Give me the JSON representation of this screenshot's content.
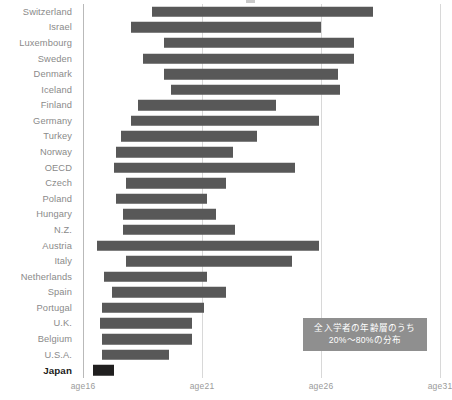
{
  "chart_data": {
    "type": "bar",
    "orientation": "horizontal",
    "subtype": "range-bar",
    "title": "",
    "subtitle": "",
    "xlabel": "",
    "ylabel": "",
    "xlim": [
      16,
      31
    ],
    "grid": true,
    "x_ticks": [
      16,
      21,
      26,
      31
    ],
    "x_tick_labels": [
      "age16",
      "age21",
      "age26",
      "age31"
    ],
    "legend_position": "bottom-right",
    "legend_text": [
      "全入学者の年齢層のうち",
      "20%～80%の分布"
    ],
    "value_unit": "age (years)",
    "bar_color": "#585858",
    "highlight_color": "#201f1f",
    "highlight_category": "Japan",
    "categories": [
      "Switzerland",
      "Israel",
      "Luxembourg",
      "Sweden",
      "Denmark",
      "Iceland",
      "Finland",
      "Germany",
      "Turkey",
      "Norway",
      "OECD",
      "Czech",
      "Poland",
      "Hungary",
      "N.Z.",
      "Austria",
      "Italy",
      "Netherlands",
      "Spain",
      "Portugal",
      "U.K.",
      "Belgium",
      "U.S.A.",
      "Japan"
    ],
    "series": [
      {
        "name": "20%–80% age distribution of all entrants",
        "ranges": [
          {
            "category": "Switzerland",
            "start": 18.9,
            "end": 28.2
          },
          {
            "category": "Israel",
            "start": 18.0,
            "end": 26.0
          },
          {
            "category": "Luxembourg",
            "start": 19.4,
            "end": 27.4
          },
          {
            "category": "Sweden",
            "start": 18.5,
            "end": 27.4
          },
          {
            "category": "Denmark",
            "start": 19.4,
            "end": 26.7
          },
          {
            "category": "Iceland",
            "start": 19.7,
            "end": 26.8
          },
          {
            "category": "Finland",
            "start": 18.3,
            "end": 24.1
          },
          {
            "category": "Germany",
            "start": 18.0,
            "end": 25.9
          },
          {
            "category": "Turkey",
            "start": 17.6,
            "end": 23.3
          },
          {
            "category": "Norway",
            "start": 17.4,
            "end": 22.3
          },
          {
            "category": "OECD",
            "start": 17.3,
            "end": 24.9
          },
          {
            "category": "Czech",
            "start": 17.8,
            "end": 22.0
          },
          {
            "category": "Poland",
            "start": 17.4,
            "end": 21.2
          },
          {
            "category": "Hungary",
            "start": 17.7,
            "end": 21.6
          },
          {
            "category": "N.Z.",
            "start": 17.7,
            "end": 22.4
          },
          {
            "category": "Austria",
            "start": 16.6,
            "end": 25.9
          },
          {
            "category": "Italy",
            "start": 17.8,
            "end": 24.8
          },
          {
            "category": "Netherlands",
            "start": 16.9,
            "end": 21.2
          },
          {
            "category": "Spain",
            "start": 17.2,
            "end": 22.0
          },
          {
            "category": "Portugal",
            "start": 16.8,
            "end": 21.1
          },
          {
            "category": "U.K.",
            "start": 16.7,
            "end": 20.6
          },
          {
            "category": "Belgium",
            "start": 16.8,
            "end": 20.6
          },
          {
            "category": "U.S.A.",
            "start": 16.8,
            "end": 19.6
          },
          {
            "category": "Japan",
            "start": 16.4,
            "end": 17.3
          }
        ]
      }
    ]
  }
}
